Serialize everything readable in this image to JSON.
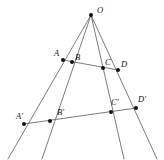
{
  "figure": {
    "width": 164,
    "height": 160,
    "background_color": "#ffffff",
    "line_color": "#5a5a5a",
    "point_color": "#111111",
    "label_color": "#111111"
  },
  "chart_data": {
    "type": "diagram",
    "subtype": "projective-geometry-cross-ratio",
    "title": "",
    "apex": {
      "name": "O",
      "x": 91,
      "y": 15
    },
    "points": [
      {
        "name": "O",
        "x": 91,
        "y": 15,
        "label": "O",
        "label_x": 97,
        "label_y": 6
      },
      {
        "name": "A",
        "x": 63,
        "y": 60,
        "label": "A",
        "label_x": 54,
        "label_y": 49
      },
      {
        "name": "B",
        "x": 72,
        "y": 62,
        "label": "B",
        "label_x": 75,
        "label_y": 53
      },
      {
        "name": "C",
        "x": 103,
        "y": 68,
        "label": "C",
        "label_x": 105,
        "label_y": 58
      },
      {
        "name": "D",
        "x": 118,
        "y": 70,
        "label": "D",
        "label_x": 121,
        "label_y": 60
      },
      {
        "name": "A'",
        "x": 24,
        "y": 124,
        "label": "A'",
        "label_x": 16,
        "label_y": 112
      },
      {
        "name": "B'",
        "x": 50,
        "y": 121,
        "label": "B'",
        "label_x": 57,
        "label_y": 108
      },
      {
        "name": "C'",
        "x": 111,
        "y": 112,
        "label": "C'",
        "label_x": 111,
        "label_y": 98
      },
      {
        "name": "D'",
        "x": 136,
        "y": 108,
        "label": "D'",
        "label_x": 138,
        "label_y": 95
      }
    ],
    "rays": [
      {
        "name": "ray-OA",
        "from": "O",
        "through": [
          "A",
          "A'"
        ],
        "x1": 91,
        "y1": 15,
        "x2": 8,
        "y2": 159
      },
      {
        "name": "ray-OB",
        "from": "O",
        "through": [
          "B",
          "B'"
        ],
        "x1": 91,
        "y1": 15,
        "x2": 42,
        "y2": 159
      },
      {
        "name": "ray-OC",
        "from": "O",
        "through": [
          "C",
          "C'"
        ],
        "x1": 91,
        "y1": 15,
        "x2": 124,
        "y2": 159
      },
      {
        "name": "ray-OD",
        "from": "O",
        "through": [
          "D",
          "D'"
        ],
        "x1": 91,
        "y1": 15,
        "x2": 157,
        "y2": 159
      }
    ],
    "transversals": [
      {
        "name": "upper-transversal",
        "points": [
          "A",
          "B",
          "C",
          "D"
        ],
        "x1": 63,
        "y1": 60,
        "x2": 118,
        "y2": 70
      },
      {
        "name": "lower-transversal",
        "points": [
          "A'",
          "B'",
          "C'",
          "D'"
        ],
        "x1": 24,
        "y1": 124,
        "x2": 136,
        "y2": 108
      }
    ]
  }
}
